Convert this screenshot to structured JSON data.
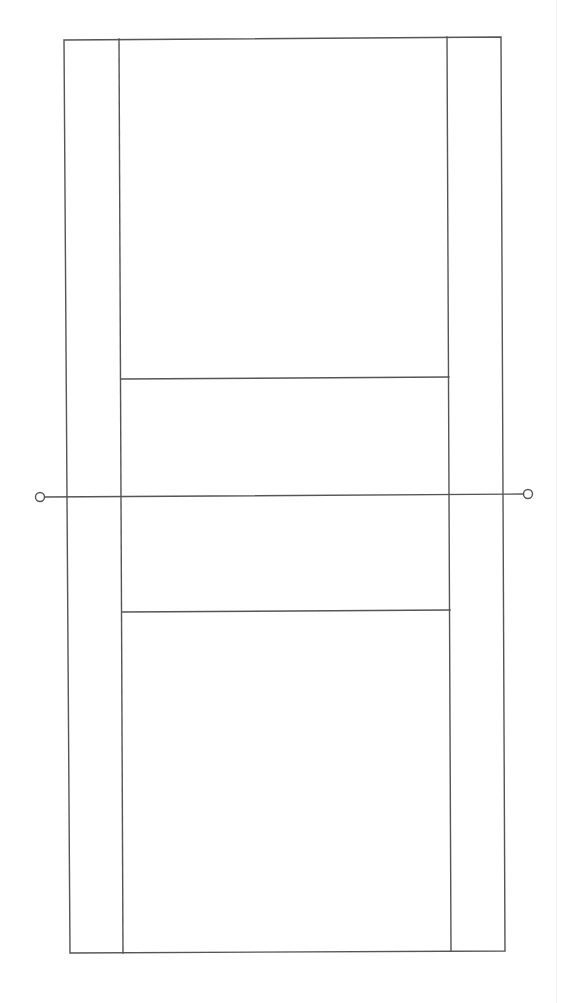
{
  "diagram": {
    "type": "court-layout",
    "colors": {
      "line": "#555555",
      "background": "#ffffff",
      "edge_strip": "#f1f1f1"
    },
    "outer_boundary": {
      "top_left": [
        64,
        40
      ],
      "top_right": [
        501,
        37
      ],
      "bottom_right": [
        505,
        951
      ],
      "bottom_left": [
        70,
        953
      ]
    },
    "singles_sidelines": {
      "left": {
        "top": [
          119,
          39
        ],
        "bottom": [
          123,
          953
        ]
      },
      "right": {
        "top": [
          447,
          37
        ],
        "bottom": [
          451,
          951
        ]
      }
    },
    "service_lines": [
      {
        "name": "far-service-line",
        "from": [
          121,
          379
        ],
        "to": [
          449,
          377
        ]
      },
      {
        "name": "near-service-line",
        "from": [
          122,
          612
        ],
        "to": [
          450,
          610
        ]
      }
    ],
    "net": {
      "from": [
        44,
        497
      ],
      "to": [
        524,
        494
      ],
      "posts": [
        {
          "name": "left-net-post",
          "center": [
            40,
            497
          ],
          "radius": 4.5
        },
        {
          "name": "right-net-post",
          "center": [
            528,
            494
          ],
          "radius": 4.5
        }
      ]
    }
  }
}
